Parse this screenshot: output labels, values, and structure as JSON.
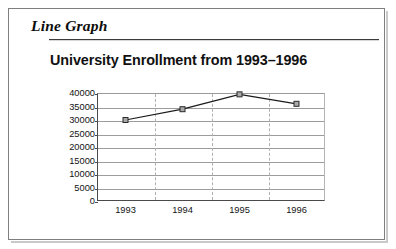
{
  "document": {
    "section_heading": "Line Graph"
  },
  "chart_data": {
    "type": "line",
    "title": "University Enrollment from 1993–1996",
    "xlabel": "",
    "ylabel": "",
    "categories": [
      "1993",
      "1994",
      "1995",
      "1996"
    ],
    "values": [
      30000,
      34000,
      39500,
      36000
    ],
    "series": [
      {
        "name": "University Enrollment",
        "values": [
          30000,
          34000,
          39500,
          36000
        ]
      }
    ],
    "ylim": [
      0,
      40000
    ],
    "ytick_labels": [
      "40000",
      "35000",
      "30000",
      "25000",
      "20000",
      "15000",
      "10000",
      "5000",
      "0"
    ],
    "ytick_values": [
      40000,
      35000,
      30000,
      25000,
      20000,
      15000,
      10000,
      5000,
      0
    ],
    "ytick_step": 5000,
    "grid": {
      "horizontal": true,
      "vertical": true,
      "horizontal_style": "solid",
      "vertical_style": "dashed"
    },
    "legend": null,
    "legend_position": "none",
    "marker": "square",
    "colors": {
      "line": "#1a1a1a",
      "marker_fill": "#a8a8a8",
      "marker_stroke": "#2b2b2b",
      "gridline": "#9c9c9c",
      "gridline_vertical": "#b0b0b0",
      "axis": "#4a4a4a",
      "text": "#141414",
      "frame": "#7f7f7f"
    }
  }
}
